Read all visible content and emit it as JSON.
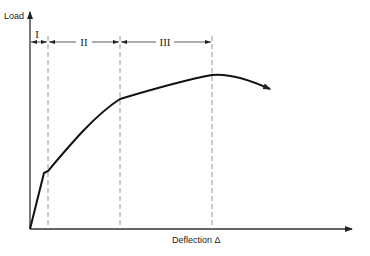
{
  "diagram": {
    "type": "load-deflection curve",
    "y_axis_label": "Load",
    "x_axis_label": "Deflection Δ",
    "regions": [
      {
        "id": "I",
        "label": "I"
      },
      {
        "id": "II",
        "label": "II"
      },
      {
        "id": "III",
        "label": "III"
      }
    ],
    "colors": {
      "curve": "#111111",
      "axis": "#333333",
      "dashed": "#888888",
      "text": "#222222"
    }
  }
}
